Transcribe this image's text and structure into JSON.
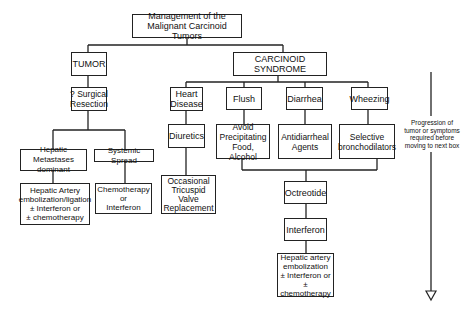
{
  "title": "Management of the\nMalignant Carcinoid Tumors",
  "tumor": {
    "label": "TUMOR",
    "resection": "? Surgical\nResection",
    "hepatic": "Hepatic Metastases\ndominant",
    "systemic": "Systemic Spread",
    "hepatic_tx": "Hepatic Artery\nembolization/ligation\n± Interferon or\n± chemotherapy",
    "systemic_tx": "Chemotherapy\nor\nInterferon"
  },
  "syndrome": {
    "label": "CARCINOID SYNDROME",
    "heart": "Heart\nDisease",
    "diuretics": "Diuretics",
    "valve": "Occasional\nTricuspid\nValve\nReplacement",
    "flush": "Flush",
    "flush_tx": "Avoid\nPrecipitating\nFood, Alcohol",
    "diarrhea": "Diarrhea",
    "diarrhea_tx": "Antidiarrheal\nAgents",
    "wheezing": "Wheezing",
    "wheezing_tx": "Selective\nbronchodilators",
    "octreotide": "Octreotide",
    "interferon": "Interferon",
    "hepatic_tx": "Hepatic artery\nembolization\n± Interferon or\n± chemotherapy"
  },
  "progression_note": "Progression of\ntumor or symptoms\nrequired before\nmoving to next box"
}
